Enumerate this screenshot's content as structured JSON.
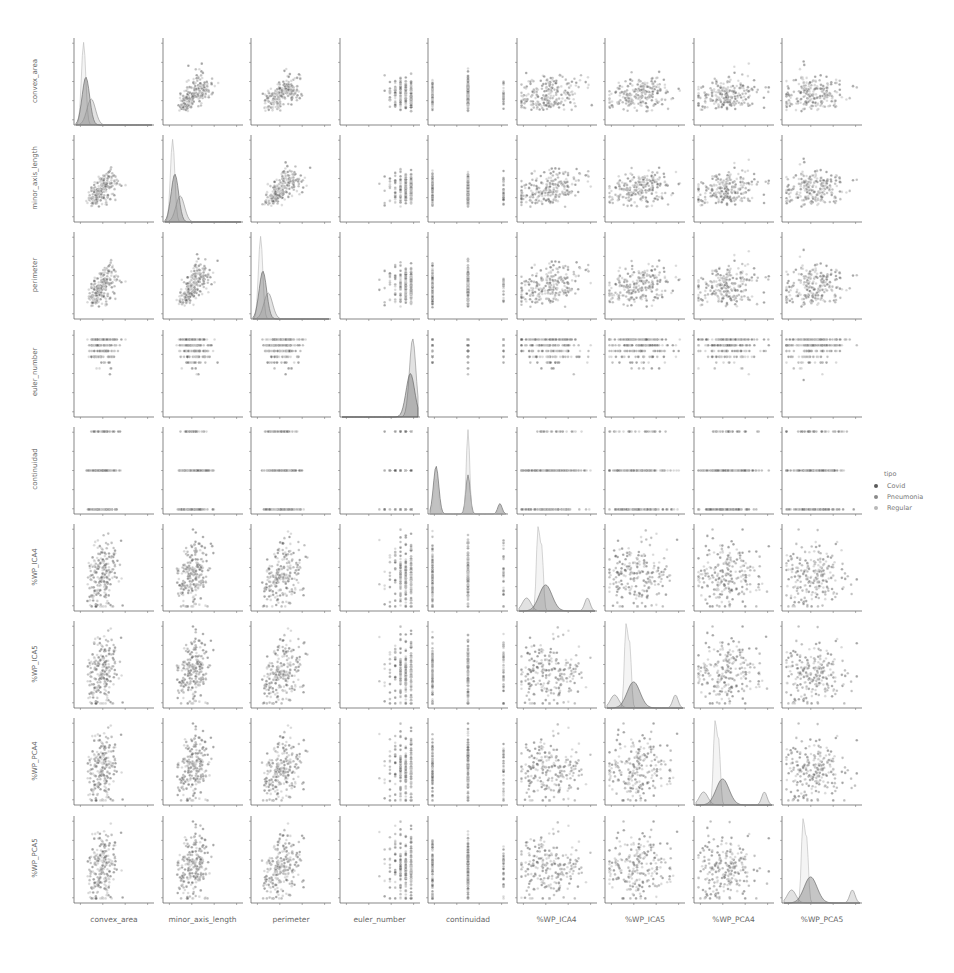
{
  "chart_data": {
    "type": "pairplot",
    "title": "",
    "variables": [
      "convex_area",
      "minor_axis_length",
      "perimeter",
      "euler_number",
      "continuidad",
      "%WP_ICA4",
      "%WP_ICA5",
      "%WP_PCA4",
      "%WP_PCA5"
    ],
    "hue": "tipo",
    "legend": {
      "title": "tipo",
      "position": "right",
      "entries": [
        {
          "label": "Covid",
          "color": "#5a5a5a"
        },
        {
          "label": "Pneumonia",
          "color": "#8a8a8a"
        },
        {
          "label": "Regular",
          "color": "#b8b8b8"
        }
      ]
    },
    "diag_kind": "kde",
    "offdiag_kind": "scatter",
    "axes": {
      "convex_area": {
        "ticks": [
          0,
          500,
          1000,
          1500,
          2000,
          2500,
          3000
        ],
        "xticks": [
          0,
          1000,
          2000,
          3000
        ],
        "range": [
          0,
          3200
        ]
      },
      "minor_axis_length": {
        "ticks": [
          0,
          10,
          20,
          30,
          40,
          50,
          60
        ],
        "xticks": [
          0,
          20,
          40,
          60
        ],
        "range": [
          0,
          62
        ]
      },
      "perimeter": {
        "ticks": [
          0,
          200,
          400,
          600,
          800
        ],
        "xticks": [
          0,
          250,
          500,
          750
        ],
        "range": [
          0,
          820
        ]
      },
      "euler_number": {
        "ticks": [
          0.0,
          -2.5,
          -5.0,
          -7.5,
          -10.0,
          -12.5
        ],
        "xticks": [
          -10,
          -5,
          0
        ],
        "range": [
          -13,
          1.5
        ]
      },
      "continuidad": {
        "ticks": [
          1.0,
          0.5,
          0.0,
          -0.5,
          -1.0
        ],
        "xticks": [
          -1,
          0,
          1
        ],
        "range": [
          -1.05,
          1.05
        ]
      },
      "%WP_ICA4": {
        "ticks": [
          0.0,
          0.2,
          0.4,
          0.6,
          0.8,
          1.0
        ],
        "xticks": [
          0.0,
          0.5,
          1.0
        ],
        "range": [
          0,
          1.02
        ]
      },
      "%WP_ICA5": {
        "ticks": [
          0.2,
          0.4,
          0.6,
          0.8
        ],
        "xticks": [
          0.0,
          0.5,
          1.0
        ],
        "range": [
          0,
          0.98
        ]
      },
      "%WP_PCA4": {
        "ticks": [
          0.0,
          0.2,
          0.4,
          0.6,
          0.8
        ],
        "xticks": [
          0.0,
          0.5,
          1.0
        ],
        "range": [
          0,
          0.95
        ]
      },
      "%WP_PCA5": {
        "ticks": [
          0.0,
          0.2,
          0.4,
          0.6,
          0.8
        ],
        "xticks": [
          0.0,
          0.5,
          1.0
        ],
        "range": [
          0,
          0.98
        ]
      }
    },
    "diagonal_peaks": {
      "convex_area": {
        "Covid": 1500,
        "Pneumonia": 3100,
        "Regular": 1400
      },
      "minor_axis_length": {
        "Covid": 50,
        "Pneumonia": 58,
        "Regular": 48
      },
      "perimeter": {
        "Covid": 350,
        "Pneumonia": 640,
        "Regular": 400
      },
      "euler_number": {
        "Covid": 0.9,
        "Pneumonia": 0.8,
        "Regular": 0.85
      },
      "continuidad": {
        "peaks_x": [
          -1,
          0,
          1
        ],
        "Covid": [
          0.55,
          0.45,
          0.12
        ],
        "Pneumonia": [
          0.4,
          1.0,
          0.1
        ],
        "Regular": [
          0.5,
          0.3,
          0.08
        ]
      },
      "%WP_ICA4": {
        "Covid": 0.3,
        "Pneumonia": 0.95,
        "Regular": 0.35
      },
      "%WP_ICA5": {
        "Covid": 0.3,
        "Pneumonia": 0.95,
        "Regular": 0.3
      },
      "%WP_PCA4": {
        "Covid": 0.35,
        "Pneumonia": 0.95,
        "Regular": 0.4
      },
      "%WP_PCA5": {
        "Covid": 0.35,
        "Pneumonia": 0.95,
        "Regular": 0.45
      }
    }
  },
  "labels": {
    "rows": [
      "convex_area",
      "minor_axis_length",
      "perimeter",
      "euler_number",
      "continuidad",
      "%WP_ICA4",
      "%WP_ICA5",
      "%WP_PCA4",
      "%WP_PCA5"
    ],
    "cols": [
      "convex_area",
      "minor_axis_length",
      "perimeter",
      "euler_number",
      "continuidad",
      "%WP_ICA4",
      "%WP_ICA5",
      "%WP_PCA4",
      "%WP_PCA5"
    ],
    "legend_title": "tipo",
    "legend_items": [
      "Covid",
      "Pneumonia",
      "Regular"
    ]
  }
}
